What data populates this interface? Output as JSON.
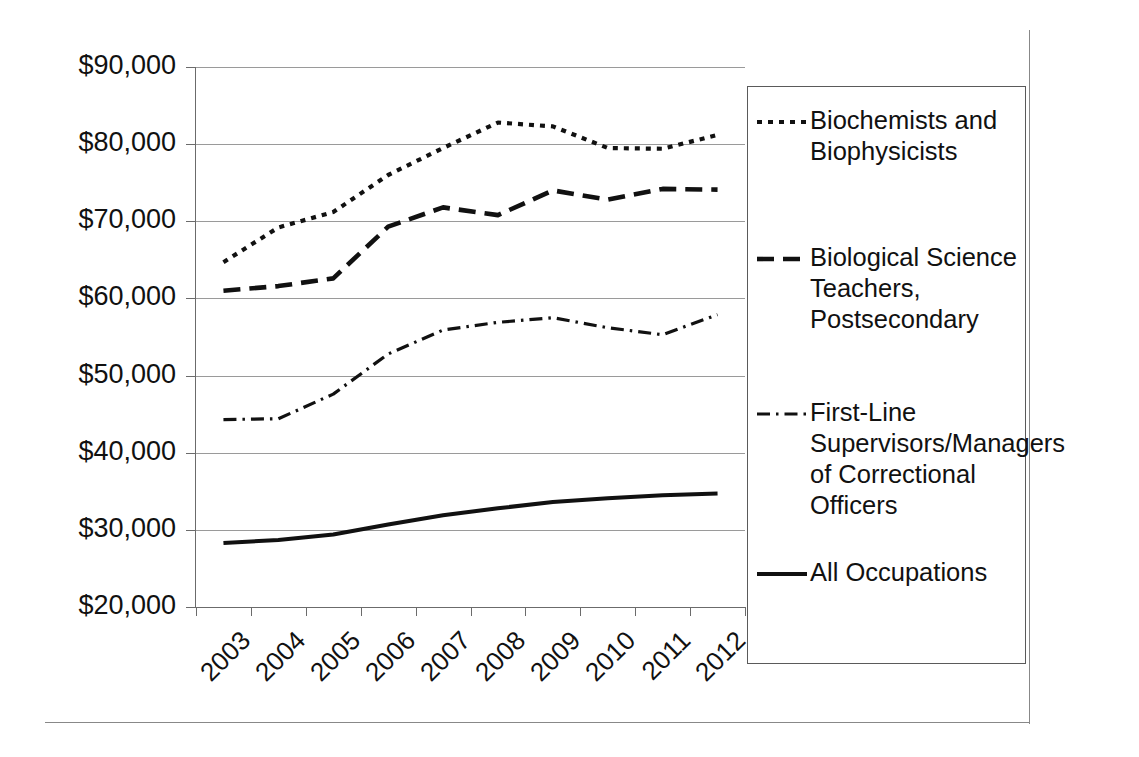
{
  "chart_data": {
    "type": "line",
    "title": "",
    "xlabel": "",
    "ylabel": "",
    "x": [
      "2003",
      "2004",
      "2005",
      "2006",
      "2007",
      "2008",
      "2009",
      "2010",
      "2011",
      "2012"
    ],
    "categories": [
      "2003",
      "2004",
      "2005",
      "2006",
      "2007",
      "2008",
      "2009",
      "2010",
      "2011",
      "2012"
    ],
    "ylim": [
      20000,
      90000
    ],
    "ytick_labels": [
      "$90,000",
      "$80,000",
      "$70,000",
      "$60,000",
      "$50,000",
      "$40,000",
      "$30,000",
      "$20,000"
    ],
    "ytick_values": [
      90000,
      80000,
      70000,
      60000,
      50000,
      40000,
      30000,
      20000
    ],
    "grid": "horizontal",
    "legend_position": "right",
    "series": [
      {
        "name": "Biochemists and Biophysicists",
        "legend_label": "Biochemists and\nBiophysicists",
        "dash_style": "dotted",
        "color": "#111111",
        "values": [
          64700,
          69200,
          71200,
          76000,
          79500,
          82800,
          82300,
          79500,
          79400,
          81200
        ]
      },
      {
        "name": "Biological Science Teachers, Postsecondary",
        "legend_label": "Biological Science\nTeachers,\nPostsecondary",
        "dash_style": "dashed",
        "color": "#111111",
        "values": [
          61000,
          61600,
          62600,
          69300,
          71800,
          70800,
          74000,
          72800,
          74200,
          74100
        ]
      },
      {
        "name": "First-Line Supervisors/Managers of Correctional Officers",
        "legend_label": "First-Line\nSupervisors/Managers\nof Correctional\nOfficers",
        "dash_style": "dash-dot",
        "color": "#111111",
        "values": [
          44300,
          44400,
          47600,
          52800,
          55900,
          56900,
          57500,
          56200,
          55300,
          57900
        ]
      },
      {
        "name": "All Occupations",
        "legend_label": "All Occupations",
        "dash_style": "solid",
        "color": "#111111",
        "values": [
          28300,
          28700,
          29400,
          30700,
          31900,
          32800,
          33600,
          34100,
          34500,
          34700
        ]
      }
    ]
  },
  "axes": {
    "y_ticks": [
      {
        "label": "$90,000",
        "value": 90000
      },
      {
        "label": "$80,000",
        "value": 80000
      },
      {
        "label": "$70,000",
        "value": 70000
      },
      {
        "label": "$60,000",
        "value": 60000
      },
      {
        "label": "$50,000",
        "value": 50000
      },
      {
        "label": "$40,000",
        "value": 40000
      },
      {
        "label": "$30,000",
        "value": 30000
      },
      {
        "label": "$20,000",
        "value": 20000
      }
    ],
    "x_ticks": [
      "2003",
      "2004",
      "2005",
      "2006",
      "2007",
      "2008",
      "2009",
      "2010",
      "2011",
      "2012"
    ]
  },
  "legend": {
    "items": [
      {
        "label": "Biochemists and\nBiophysicists",
        "style": "dotted"
      },
      {
        "label": "Biological Science\nTeachers,\nPostsecondary",
        "style": "dashed"
      },
      {
        "label": "First-Line\nSupervisors/Managers\nof Correctional\nOfficers",
        "style": "dash-dot"
      },
      {
        "label": "All Occupations",
        "style": "solid"
      }
    ]
  },
  "style": {
    "grid_color": "#9a9a9a",
    "axis_color": "#6b6b6b",
    "line_color": "#111111",
    "frame_color": "#888888",
    "background": "#ffffff"
  }
}
